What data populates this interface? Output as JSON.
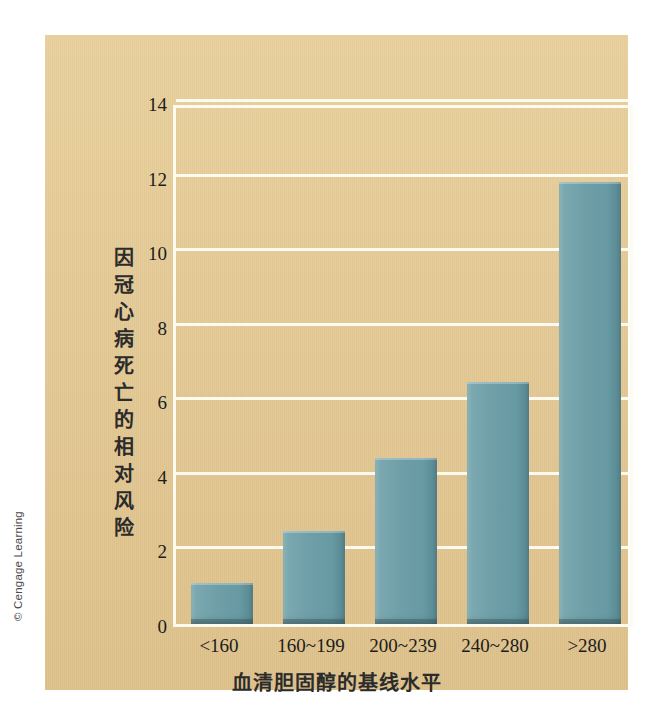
{
  "credit": "© Cengage Learning",
  "chart_data": {
    "type": "bar",
    "title": "",
    "xlabel": "血清胆固醇的基线水平",
    "ylabel": "因冠心病死亡的相对风险",
    "categories": [
      "<160",
      "160~199",
      "200~239",
      "240~280",
      ">280"
    ],
    "values": [
      1.1,
      2.5,
      4.45,
      6.5,
      11.85
    ],
    "ylim": [
      0,
      14
    ],
    "yticks": [
      0,
      2,
      4,
      6,
      8,
      10,
      12,
      14
    ],
    "ytick_labels": [
      "0",
      "2",
      "4",
      "6",
      "8",
      "10",
      "12",
      "14"
    ],
    "grid": true,
    "legend": false,
    "bar_color": "#6f9fa8",
    "panel_color": "#e3c894",
    "grid_color": "#fdfaf0",
    "ylabel_chars": [
      "因",
      "冠",
      "心",
      "病",
      "死",
      "亡",
      "的",
      "相",
      "对",
      "风",
      "险"
    ]
  }
}
